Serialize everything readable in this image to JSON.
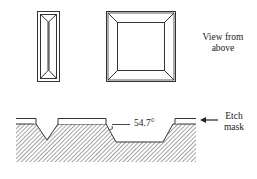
{
  "diagram": {
    "top_view": {
      "caption_line1": "View from",
      "caption_line2": "above",
      "shapes": [
        "narrow-v-groove-top-view",
        "square-pit-top-view"
      ]
    },
    "cross_section": {
      "angle_label": "54.7°",
      "mask_label_line1": "Etch",
      "mask_label_line2": "mask",
      "features": [
        "v-groove",
        "trapezoidal-pit"
      ]
    },
    "colors": {
      "line": "#333333",
      "hatch": "#555555",
      "background": "#ffffff"
    }
  }
}
